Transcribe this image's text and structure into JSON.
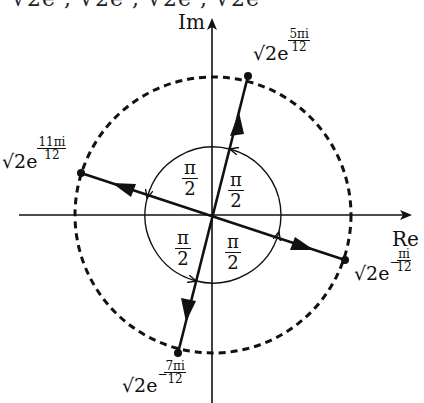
{
  "header_cutoff_text": "√2e   , √2e   , √2e   , √2e",
  "axes": {
    "real_label": "Re",
    "imag_label": "Im"
  },
  "center": [
    213,
    215
  ],
  "outer_circle": {
    "style": "dashed",
    "radius": 138
  },
  "inner_circle": {
    "style": "solid",
    "radius": 68
  },
  "points": [
    {
      "id": "p1",
      "magnitude": "√2",
      "base": "e",
      "exponent_num": "5πi",
      "exponent_den": "12",
      "negative": false,
      "angle_deg": 75
    },
    {
      "id": "p2",
      "magnitude": "√2",
      "base": "e",
      "exponent_num": "11πi",
      "exponent_den": "12",
      "negative": false,
      "angle_deg": 165
    },
    {
      "id": "p3",
      "magnitude": "√2",
      "base": "e",
      "exponent_num": "πi",
      "exponent_den": "12",
      "negative": true,
      "angle_deg": -15
    },
    {
      "id": "p4",
      "magnitude": "√2",
      "base": "e",
      "exponent_num": "7πi",
      "exponent_den": "12",
      "negative": true,
      "angle_deg": -105
    }
  ],
  "angle_labels": [
    {
      "num": "π",
      "den": "2",
      "quadrant": "upper-right"
    },
    {
      "num": "π",
      "den": "2",
      "quadrant": "upper-left"
    },
    {
      "num": "π",
      "den": "2",
      "quadrant": "lower-left"
    },
    {
      "num": "π",
      "den": "2",
      "quadrant": "lower-right"
    }
  ]
}
